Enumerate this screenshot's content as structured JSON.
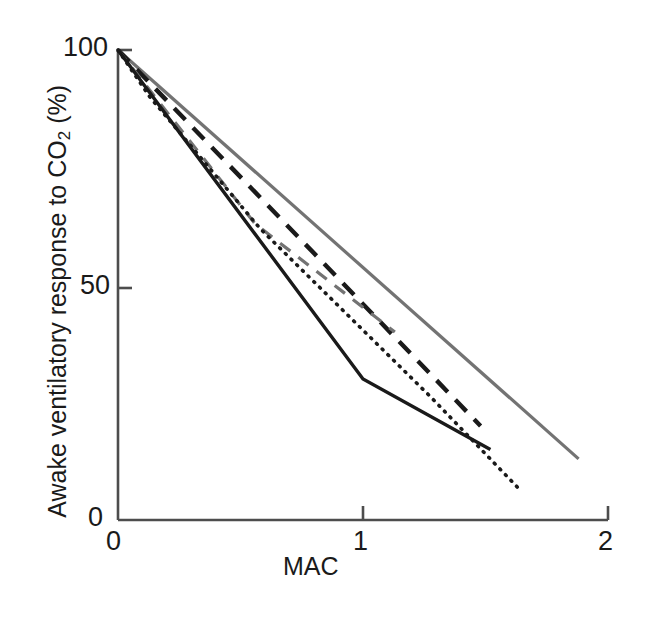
{
  "figure": {
    "background": "#ffffff",
    "width": 653,
    "height": 620
  },
  "axis": {
    "y_label_prefix": "Awake ventilatory response to CO",
    "y_label_sub": "2",
    "y_label_suffix": " (%)",
    "x_label": "MAC",
    "y_ticks": [
      "0",
      "50",
      "100"
    ],
    "x_ticks": [
      "0",
      "1",
      "2"
    ],
    "axis_color": "#4d4d4d"
  },
  "chart_data": {
    "type": "line",
    "title": "",
    "xlabel": "MAC",
    "ylabel": "Awake ventilatory response to CO2 (%)",
    "xlim": [
      0,
      2
    ],
    "ylim": [
      0,
      100
    ],
    "xticks": [
      0,
      1,
      2
    ],
    "yticks": [
      0,
      50,
      100
    ],
    "grid": false,
    "legend": "none",
    "series": [
      {
        "name": "series-gray-solid",
        "style": "solid",
        "color": "#737373",
        "width": 3.2,
        "x": [
          0,
          1.88
        ],
        "y": [
          100,
          13
        ]
      },
      {
        "name": "series-black-dashed",
        "style": "dashed",
        "color": "#1a1a1a",
        "width": 4.4,
        "dash": [
          16,
          11
        ],
        "x": [
          0,
          1.48
        ],
        "y": [
          100,
          20
        ]
      },
      {
        "name": "series-gray-dashed",
        "style": "dashed",
        "color": "#737373",
        "width": 3.2,
        "dash": [
          13,
          10
        ],
        "x": [
          0,
          0.56,
          1.13
        ],
        "y": [
          100,
          63,
          40
        ]
      },
      {
        "name": "series-black-solid",
        "style": "solid",
        "color": "#1a1a1a",
        "width": 3.4,
        "x": [
          0,
          1.0,
          1.52
        ],
        "y": [
          100,
          30,
          15
        ]
      },
      {
        "name": "series-dotted",
        "style": "dotted",
        "color": "#1a1a1a",
        "width": 3.6,
        "dash": [
          1,
          7
        ],
        "x": [
          0,
          0.13,
          0.58,
          1.28,
          1.63
        ],
        "y": [
          100,
          90,
          62,
          26,
          7
        ]
      }
    ]
  }
}
